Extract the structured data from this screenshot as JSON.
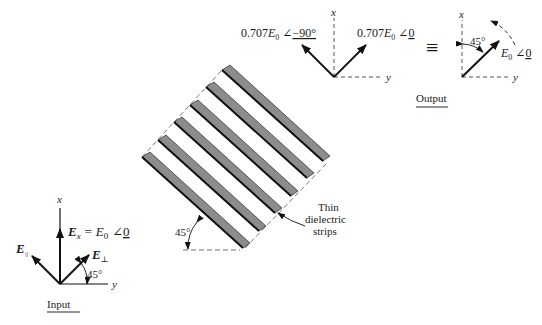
{
  "input_panel": {
    "axis_x": "x",
    "axis_y": "y",
    "ex_label_main": "E",
    "ex_label_sub": "x",
    "ex_label_eq": "= E",
    "ex_label_eq_sub": "0",
    "ex_label_phase": "0",
    "e_parallel_main": "E",
    "e_parallel_sub": "||",
    "e_perp_main": "E",
    "e_perp_sub": "⊥",
    "angle": "45°",
    "caption": "Input"
  },
  "grating": {
    "strip_count": 6,
    "angle": "45°",
    "callout_line1": "Thin",
    "callout_line2": "dielectric",
    "callout_line3": "strips",
    "strip_fill": "#8c8c8c",
    "strip_edge": "#111111"
  },
  "output_components": {
    "axis_x": "x",
    "axis_y": "y",
    "left_coef": "0.707",
    "left_main": "E",
    "left_sub": "0",
    "left_phase": "−90°",
    "right_coef": "0.707",
    "right_main": "E",
    "right_sub": "0",
    "right_phase": "0"
  },
  "equivalence_symbol": "≡",
  "output_panel": {
    "axis_x": "x",
    "axis_y": "y",
    "angle": "45°",
    "field_main": "E",
    "field_sub": "0",
    "field_phase": "0",
    "caption": "Output"
  }
}
